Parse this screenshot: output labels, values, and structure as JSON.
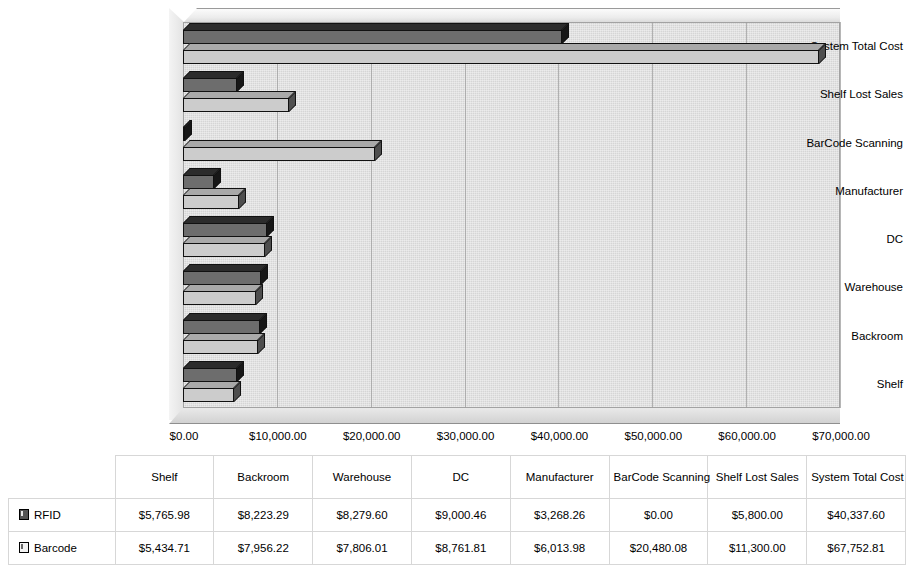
{
  "chart_data": {
    "type": "bar",
    "orientation": "horizontal",
    "title": "",
    "xlabel": "",
    "ylabel": "",
    "xlim": [
      0,
      70000
    ],
    "xticks": [
      "$0.00",
      "$10,000.00",
      "$20,000.00",
      "$30,000.00",
      "$40,000.00",
      "$50,000.00",
      "$60,000.00",
      "$70,000.00"
    ],
    "xtick_values": [
      0,
      10000,
      20000,
      30000,
      40000,
      50000,
      60000,
      70000
    ],
    "grid": true,
    "legend_position": "table",
    "categories": [
      "Shelf",
      "Backroom",
      "Warehouse",
      "DC",
      "Manufacturer",
      "BarCode Scanning",
      "Shelf Lost Sales",
      "System Total Cost"
    ],
    "axis_order_top_to_bottom": [
      "System Total Cost",
      "Shelf Lost Sales",
      "BarCode Scanning",
      "Manufacturer",
      "DC",
      "Warehouse",
      "Backroom",
      "Shelf"
    ],
    "series": [
      {
        "name": "RFID",
        "color": "#6d6d6d",
        "values": [
          5765.98,
          8223.29,
          8279.6,
          9000.46,
          3268.26,
          0.0,
          5800.0,
          40337.6
        ],
        "labels": [
          "$5,765.98",
          "$8,223.29",
          "$8,279.60",
          "$9,000.46",
          "$3,268.26",
          "$0.00",
          "$5,800.00",
          "$40,337.60"
        ]
      },
      {
        "name": "Barcode",
        "color": "#cccccc",
        "values": [
          5434.71,
          7956.22,
          7806.01,
          8761.81,
          6013.98,
          20480.08,
          11300.0,
          67752.81
        ],
        "labels": [
          "$5,434.71",
          "$7,956.22",
          "$7,806.01",
          "$8,761.81",
          "$6,013.98",
          "$20,480.08",
          "$11,300.00",
          "$67,752.81"
        ]
      }
    ]
  },
  "table": {
    "corner_label": "",
    "columns": [
      "Shelf",
      "Backroom",
      "Warehouse",
      "DC",
      "Manufacturer",
      "BarCode Scanning",
      "Shelf Lost Sales",
      "System Total Cost"
    ],
    "rows": [
      {
        "label": "RFID",
        "marker": "dark-square-icon",
        "cells": [
          "$5,765.98",
          "$8,223.29",
          "$8,279.60",
          "$9,000.46",
          "$3,268.26",
          "$0.00",
          "$5,800.00",
          "$40,337.60"
        ]
      },
      {
        "label": "Barcode",
        "marker": "light-square-icon",
        "cells": [
          "$5,434.71",
          "$7,956.22",
          "$7,806.01",
          "$8,761.81",
          "$6,013.98",
          "$20,480.08",
          "$11,300.00",
          "$67,752.81"
        ]
      }
    ]
  }
}
